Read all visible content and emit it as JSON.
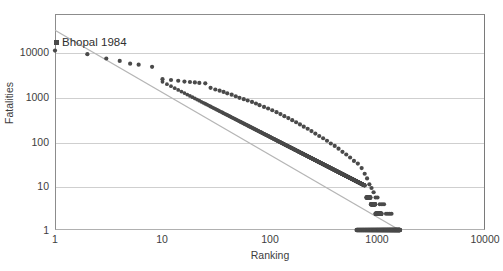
{
  "chart_data": {
    "type": "scatter",
    "title": "",
    "xlabel": "Ranking",
    "ylabel": "Fatalities",
    "xscale": "log",
    "yscale": "log",
    "xlim": [
      1,
      10000
    ],
    "ylim": [
      1,
      10000
    ],
    "xticks": [
      1,
      10,
      100,
      1000,
      10000
    ],
    "xtick_labels": [
      "1",
      "10",
      "100",
      "1000",
      "10000"
    ],
    "yticks": [
      1,
      10,
      100,
      1000,
      10000
    ],
    "ytick_labels": [
      "1",
      "10",
      "100",
      "1000",
      "10000"
    ],
    "grid": "horizontal",
    "legend": "none",
    "marker_color": "#4a4a4a",
    "trendline_color": "#b5b5b5",
    "gridline_color": "#cfcfcf",
    "annotations": [
      {
        "text": "Bhopal 1984",
        "x": 1,
        "y": 10000,
        "marker": true
      }
    ],
    "series": [
      {
        "name": "Industrial accident fatalities (rank-ordered)",
        "marker": "circle",
        "points": [
          [
            1,
            2100
          ],
          [
            2,
            1800
          ],
          [
            3,
            1500
          ],
          [
            4,
            1350
          ],
          [
            5,
            1200
          ],
          [
            6,
            1150
          ],
          [
            8,
            1050
          ],
          [
            10,
            620
          ],
          [
            12,
            600
          ],
          [
            14,
            580
          ],
          [
            16,
            560
          ],
          [
            18,
            550
          ],
          [
            20,
            540
          ],
          [
            22,
            530
          ],
          [
            25,
            520
          ],
          [
            28,
            430
          ],
          [
            31,
            400
          ],
          [
            34,
            380
          ],
          [
            37,
            360
          ],
          [
            40,
            340
          ],
          [
            44,
            320
          ],
          [
            48,
            300
          ],
          [
            52,
            280
          ],
          [
            57,
            265
          ],
          [
            62,
            250
          ],
          [
            68,
            235
          ],
          [
            74,
            220
          ],
          [
            80,
            205
          ],
          [
            88,
            190
          ],
          [
            96,
            178
          ],
          [
            105,
            165
          ],
          [
            115,
            152
          ],
          [
            125,
            140
          ],
          [
            136,
            128
          ],
          [
            148,
            118
          ],
          [
            161,
            108
          ],
          [
            175,
            99
          ],
          [
            190,
            90
          ],
          [
            206,
            82
          ],
          [
            224,
            75
          ],
          [
            243,
            68
          ],
          [
            264,
            61
          ],
          [
            287,
            55
          ],
          [
            312,
            50
          ],
          [
            339,
            45
          ],
          [
            368,
            40
          ],
          [
            400,
            36
          ],
          [
            434,
            32
          ],
          [
            472,
            28
          ],
          [
            512,
            25
          ],
          [
            556,
            22
          ],
          [
            604,
            19
          ],
          [
            656,
            17
          ],
          [
            712,
            14
          ],
          [
            760,
            11
          ],
          [
            800,
            9
          ],
          [
            840,
            7
          ],
          [
            880,
            6
          ],
          [
            920,
            5
          ],
          [
            960,
            4
          ],
          [
            1000,
            4
          ],
          [
            1050,
            3
          ],
          [
            1100,
            3
          ],
          [
            1150,
            3
          ],
          [
            1200,
            2
          ],
          [
            1250,
            2
          ],
          [
            1300,
            2
          ],
          [
            1350,
            2
          ],
          [
            1400,
            1
          ],
          [
            1450,
            1
          ],
          [
            1500,
            1
          ],
          [
            1550,
            1
          ],
          [
            1600,
            1
          ],
          [
            650,
            1
          ],
          [
            700,
            1
          ],
          [
            750,
            1
          ],
          [
            800,
            1
          ],
          [
            850,
            1
          ],
          [
            900,
            1
          ],
          [
            950,
            1
          ],
          [
            1000,
            1
          ],
          [
            1100,
            1
          ],
          [
            1200,
            1
          ],
          [
            1300,
            1
          ]
        ]
      }
    ],
    "trendline": {
      "name": "power-law fit",
      "from": [
        1,
        5000
      ],
      "to": [
        1600,
        1
      ]
    }
  }
}
